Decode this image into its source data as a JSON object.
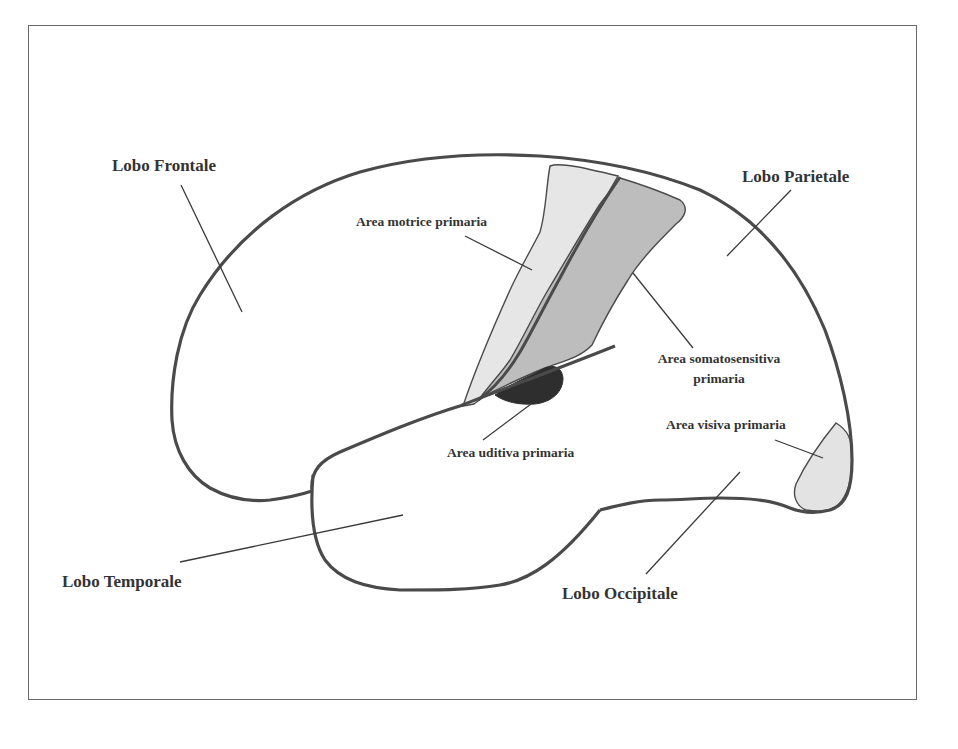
{
  "diagram": {
    "type": "brain-lateral-view",
    "language": "it",
    "colors": {
      "outline": "#4a4a4a",
      "leader_line": "#3a3a3a",
      "motor_area_fill": "#e6e6e6",
      "somatosensory_area_fill": "#bdbdbd",
      "auditory_area_fill": "#2e2e2e",
      "visual_area_fill": "#e3e3e3",
      "label_text": "#333333",
      "frame_border": "#6a6a6a"
    },
    "lobes": {
      "frontal": "Lobo Frontale",
      "parietal": "Lobo Parietale",
      "temporal": "Lobo Temporale",
      "occipital": "Lobo Occipitale"
    },
    "areas": {
      "motor": "Area motrice primaria",
      "somatosensory_line1": "Area somatosensitiva",
      "somatosensory_line2": "primaria",
      "visual": "Area visiva primaria",
      "auditory": "Area uditiva primaria"
    }
  }
}
